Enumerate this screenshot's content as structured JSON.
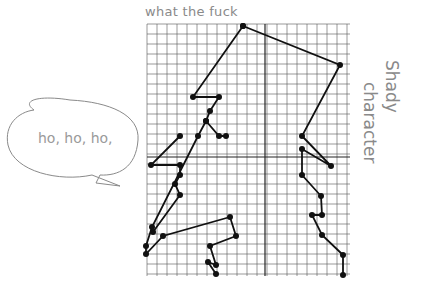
{
  "title_text": "what the fuck",
  "speech_bubble": {
    "text": "ho, ho, ho,"
  },
  "side_text": {
    "line1": "Shady",
    "line2": "character"
  },
  "colors": {
    "grid": "#555555",
    "ink": "#111111",
    "pencil": "#8a8a8a"
  },
  "grid": {
    "left": 147,
    "top": 24,
    "right": 350,
    "bottom": 276,
    "cell": 10,
    "y_axis_x": 265,
    "x_axis_y": 157
  },
  "figure": {
    "left_outline": [
      [
        243,
        26
      ],
      [
        193,
        97
      ],
      [
        219,
        97
      ],
      [
        210,
        111
      ],
      [
        206,
        121
      ],
      [
        198,
        136
      ],
      [
        152,
        227
      ],
      [
        146,
        246
      ],
      [
        146,
        254
      ],
      [
        163,
        236
      ],
      [
        230,
        217
      ],
      [
        236,
        236
      ],
      [
        210,
        246
      ],
      [
        216,
        265
      ],
      [
        208,
        262
      ],
      [
        216,
        274
      ]
    ],
    "left_branch": [
      [
        206,
        121
      ],
      [
        219,
        136
      ],
      [
        226,
        136
      ]
    ],
    "left_lower": [
      [
        180,
        136
      ],
      [
        151,
        165
      ],
      [
        180,
        165
      ],
      [
        180,
        175
      ],
      [
        175,
        184
      ],
      [
        180,
        195
      ],
      [
        153,
        232
      ]
    ],
    "top_edge": [
      [
        243,
        26
      ],
      [
        340,
        65
      ],
      [
        302,
        136
      ],
      [
        331,
        166
      ],
      [
        302,
        149
      ],
      [
        302,
        175
      ],
      [
        321,
        196
      ],
      [
        322,
        215
      ],
      [
        312,
        215
      ],
      [
        322,
        235
      ],
      [
        343,
        255
      ],
      [
        343,
        275
      ]
    ]
  }
}
